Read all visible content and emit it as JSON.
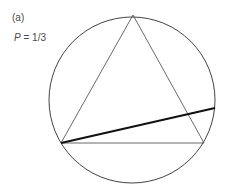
{
  "figure": {
    "panel_label": "(a)",
    "probability": {
      "variable": "P",
      "equals": " = ",
      "value": "1/3"
    }
  },
  "geometry": {
    "circle": {
      "cx": 132,
      "cy": 100,
      "r": 83
    },
    "triangle": {
      "top": [
        133,
        15
      ],
      "left": [
        61,
        143
      ],
      "right": [
        204,
        143
      ]
    },
    "chord": {
      "from": [
        61,
        143
      ],
      "to": [
        215,
        108
      ]
    }
  },
  "colors": {
    "stroke": "#444444",
    "chord": "#111111",
    "text": "#4a4a4a"
  }
}
